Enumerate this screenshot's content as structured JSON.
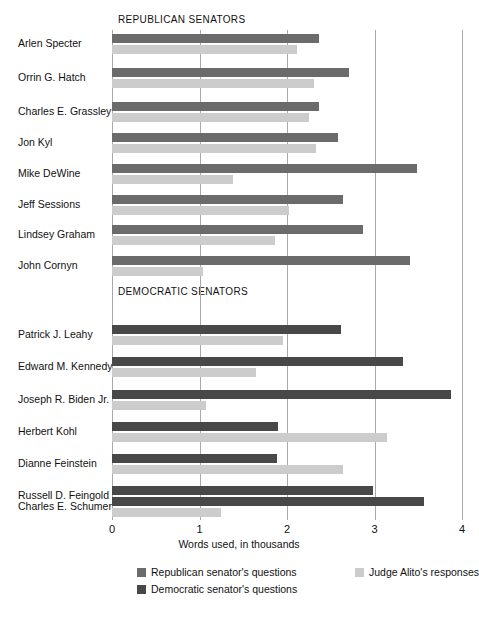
{
  "chart_data": {
    "type": "bar",
    "orientation": "horizontal",
    "title": "",
    "xlabel": "Words used, in thousands",
    "ylabel": "",
    "xlim": [
      0,
      4
    ],
    "xticks": [
      "0",
      "1",
      "2",
      "3",
      "4"
    ],
    "grid": true,
    "legend_position": "bottom",
    "groups": [
      {
        "label": "REPUBLICAN SENATORS",
        "categories": [
          "Arlen Specter",
          "Orrin G. Hatch",
          "Charles E. Grassley",
          "Jon Kyl",
          "Mike DeWine",
          "Jeff Sessions",
          "Lindsey Graham",
          "John Cornyn"
        ],
        "series": [
          {
            "name": "Republican senator's questions",
            "color": "#6b6b6b",
            "values": [
              2.37,
              2.71,
              2.36,
              2.58,
              3.49,
              2.64,
              2.87,
              3.4
            ]
          },
          {
            "name": "Judge Alito's responses",
            "color": "#cccccc",
            "values": [
              2.11,
              2.31,
              2.25,
              2.33,
              1.38,
              2.02,
              1.86,
              1.04
            ]
          }
        ]
      },
      {
        "label": "DEMOCRATIC SENATORS",
        "categories": [
          "Patrick J. Leahy",
          "Edward M. Kennedy",
          "Joseph R. Biden Jr.",
          "Herbert Kohl",
          "Dianne Feinstein",
          "Russell D. Feingold",
          "Charles E. Schumer"
        ],
        "series": [
          {
            "name": "Democratic senator's questions",
            "color": "#484848",
            "values": [
              2.62,
              3.33,
              3.87,
              1.9,
              1.89,
              2.98,
              3.57
            ]
          },
          {
            "name": "Judge Alito's responses",
            "color": "#cccccc",
            "values": [
              1.95,
              1.64,
              1.07,
              3.14,
              2.64,
              2.42,
              1.25
            ]
          }
        ]
      }
    ],
    "legend": [
      {
        "label": "Republican senator's questions",
        "color": "#6b6b6b"
      },
      {
        "label": "Democratic senator's questions",
        "color": "#484848"
      },
      {
        "label": "Judge Alito's responses",
        "color": "#cccccc"
      }
    ]
  },
  "axis": {
    "title": "Words used, in thousands",
    "ticks": [
      "0",
      "1",
      "2",
      "3",
      "4"
    ]
  },
  "sections": {
    "republican_title": "REPUBLICAN SENATORS",
    "democratic_title": "DEMOCRATIC SENATORS"
  }
}
